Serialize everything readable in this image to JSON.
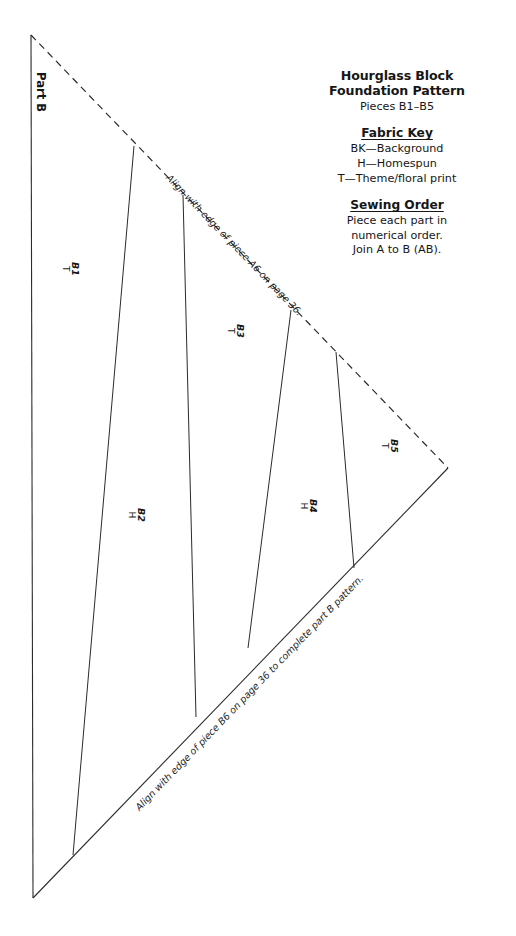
{
  "document": {
    "kind": "quilt-foundation-pattern",
    "part_label": "Part B"
  },
  "legend": {
    "title_line_1": "Hourglass Block",
    "title_line_2": "Foundation Pattern",
    "subtitle": "Pieces B1–B5",
    "fabric_key": {
      "heading": "Fabric Key",
      "entries": [
        "BK—Background",
        "H—Homespun",
        "T—Theme/floral print"
      ]
    },
    "sewing_order": {
      "heading": "Sewing Order",
      "lines": [
        "Piece each part in",
        "numerical order.",
        "Join A to B (AB)."
      ]
    }
  },
  "pieces": [
    {
      "id": "B1",
      "fabric": "T"
    },
    {
      "id": "B2",
      "fabric": "H"
    },
    {
      "id": "B3",
      "fabric": "T"
    },
    {
      "id": "B4",
      "fabric": "H"
    },
    {
      "id": "B5",
      "fabric": "T"
    }
  ],
  "edge_captions": {
    "top": "Align with edge of piece A6 on page 36.",
    "bottom": "Align with edge of piece B6 on page 36 to complete part B pattern."
  },
  "geometry": {
    "apex": [
      31,
      35
    ],
    "bottom_left": [
      33,
      898
    ],
    "right_vertex": [
      448,
      468
    ],
    "top_edge_style": "dashed",
    "bottom_edge_style": "solid",
    "left_edge_style": "solid",
    "seam_lines": [
      {
        "from": [
          134,
          146
        ],
        "to": [
          73,
          855
        ]
      },
      {
        "from": [
          183,
          195
        ],
        "to": [
          196,
          717
        ]
      },
      {
        "from": [
          291,
          310
        ],
        "to": [
          248,
          648
        ]
      },
      {
        "from": [
          336,
          352
        ],
        "to": [
          354,
          568
        ]
      }
    ]
  },
  "colors": {
    "ink": "#161616",
    "line": "#2b2b2b",
    "paper": "#ffffff"
  }
}
